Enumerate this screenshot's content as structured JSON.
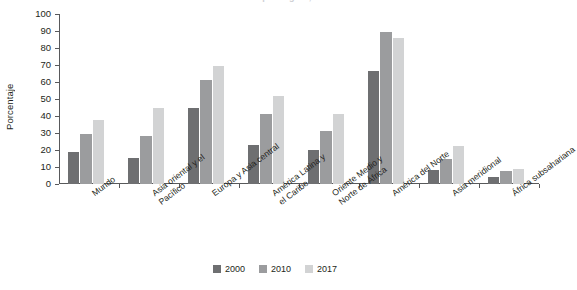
{
  "figure": {
    "clipped_title": "Uso de Internet por región, 2000-2017",
    "ylabel": "Porcentaje"
  },
  "legend": {
    "items": [
      {
        "label": "2000",
        "color": "#6e6f71"
      },
      {
        "label": "2010",
        "color": "#9b9c9e"
      },
      {
        "label": "2017",
        "color": "#d2d3d4"
      }
    ]
  },
  "chart_data": {
    "type": "bar",
    "title": "",
    "xlabel": "",
    "ylabel": "Porcentaje",
    "ylim": [
      0,
      100
    ],
    "yticks": [
      0,
      10,
      20,
      30,
      40,
      50,
      60,
      70,
      80,
      90,
      100
    ],
    "grid": false,
    "legend_position": "bottom-center",
    "categories": [
      "Mundo",
      "Asia oriental y el\nPacífico",
      "Europa y Asia central",
      "América Latina y\nel Caribe",
      "Oriente Medio y\nNorte de África",
      "América del Norte",
      "Asia meridional",
      "África subsahariana"
    ],
    "series": [
      {
        "name": "2000",
        "color": "#6e6f71",
        "values": [
          19,
          15.5,
          44.5,
          23,
          20,
          66.5,
          8,
          4
        ]
      },
      {
        "name": "2010",
        "color": "#9b9c9e",
        "values": [
          29.5,
          28,
          61,
          41,
          31,
          89.5,
          15,
          7.5
        ]
      },
      {
        "name": "2017",
        "color": "#d2d3d4",
        "values": [
          37.5,
          45,
          69.5,
          51.5,
          41,
          86,
          22.5,
          9
        ]
      }
    ]
  }
}
